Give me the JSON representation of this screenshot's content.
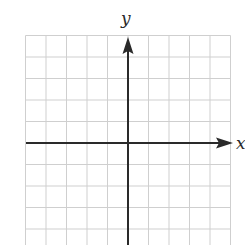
{
  "diagram": {
    "type": "coordinate-plane",
    "x_axis_label": "x",
    "y_axis_label": "y",
    "grid": {
      "columns_left_of_y_axis": 5,
      "columns_right_of_y_axis": 5,
      "rows_above_x_axis": 5,
      "rows_below_x_axis_visible": 5,
      "cell_width_px": 20.5,
      "cell_height_px": 21.5
    },
    "colors": {
      "grid_line": "#cfcfcf",
      "axis_line": "#2a2a2a",
      "background": "#ffffff"
    }
  }
}
